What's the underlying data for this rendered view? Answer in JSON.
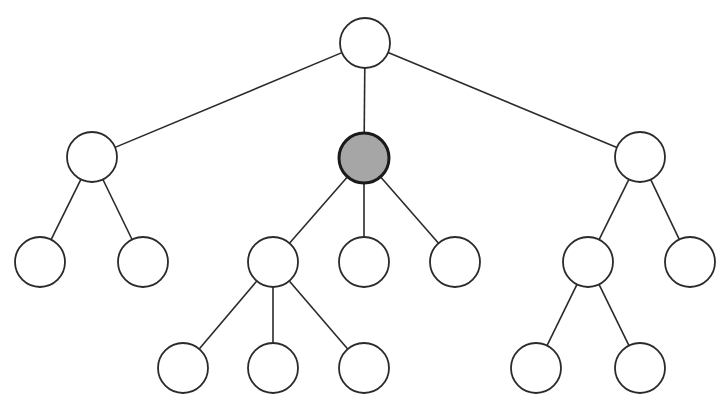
{
  "diagram": {
    "type": "tree",
    "node_radius": 25,
    "colors": {
      "edge": "#2a2a2a",
      "node_fill": "#ffffff",
      "node_stroke": "#2a2a2a",
      "highlight_fill": "#a6a6a6",
      "highlight_stroke": "#1a1a1a"
    },
    "nodes": [
      {
        "id": "root",
        "x": 365,
        "y": 43,
        "highlight": false
      },
      {
        "id": "a",
        "x": 92,
        "y": 157,
        "highlight": false
      },
      {
        "id": "b",
        "x": 364,
        "y": 158,
        "highlight": true
      },
      {
        "id": "c",
        "x": 640,
        "y": 157,
        "highlight": false
      },
      {
        "id": "a1",
        "x": 40,
        "y": 262,
        "highlight": false
      },
      {
        "id": "a2",
        "x": 143,
        "y": 262,
        "highlight": false
      },
      {
        "id": "b1",
        "x": 273,
        "y": 262,
        "highlight": false
      },
      {
        "id": "b2",
        "x": 364,
        "y": 262,
        "highlight": false
      },
      {
        "id": "b3",
        "x": 455,
        "y": 262,
        "highlight": false
      },
      {
        "id": "c1",
        "x": 588,
        "y": 262,
        "highlight": false
      },
      {
        "id": "c2",
        "x": 690,
        "y": 262,
        "highlight": false
      },
      {
        "id": "b1a",
        "x": 183,
        "y": 368,
        "highlight": false
      },
      {
        "id": "b1b",
        "x": 273,
        "y": 368,
        "highlight": false
      },
      {
        "id": "b1c",
        "x": 364,
        "y": 368,
        "highlight": false
      },
      {
        "id": "c1a",
        "x": 536,
        "y": 368,
        "highlight": false
      },
      {
        "id": "c1b",
        "x": 640,
        "y": 368,
        "highlight": false
      }
    ],
    "edges": [
      [
        "root",
        "a"
      ],
      [
        "root",
        "b"
      ],
      [
        "root",
        "c"
      ],
      [
        "a",
        "a1"
      ],
      [
        "a",
        "a2"
      ],
      [
        "b",
        "b1"
      ],
      [
        "b",
        "b2"
      ],
      [
        "b",
        "b3"
      ],
      [
        "c",
        "c1"
      ],
      [
        "c",
        "c2"
      ],
      [
        "b1",
        "b1a"
      ],
      [
        "b1",
        "b1b"
      ],
      [
        "b1",
        "b1c"
      ],
      [
        "c1",
        "c1a"
      ],
      [
        "c1",
        "c1b"
      ]
    ]
  }
}
